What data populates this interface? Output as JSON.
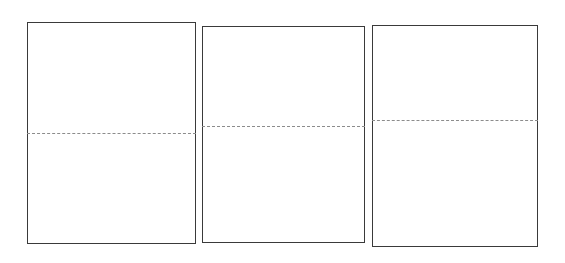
{
  "canvas": {
    "width": 565,
    "height": 263,
    "background_color": "#ffffff"
  },
  "style": {
    "panel_fill_color": "#ffffff",
    "panel_border_color": "#3a3a3a",
    "panel_border_width_px": 1.4,
    "fold_line_color": "#8c8c8c",
    "fold_line_width_px": 1.2,
    "fold_line_style": "dashed"
  },
  "figure": {
    "panel_count": 3,
    "orientation": "horizontal-row",
    "panels": [
      {
        "id": "panel-1",
        "index": 1,
        "x": 27,
        "y": 22,
        "width": 169,
        "height": 222,
        "fold_line": {
          "y_offset_px": 111,
          "y_fraction": 0.5,
          "spans_full_width": true
        }
      },
      {
        "id": "panel-2",
        "index": 2,
        "x": 202,
        "y": 26,
        "width": 163,
        "height": 217,
        "fold_line": {
          "y_offset_px": 100,
          "y_fraction": 0.46,
          "spans_full_width": true
        }
      },
      {
        "id": "panel-3",
        "index": 3,
        "x": 372,
        "y": 25,
        "width": 166,
        "height": 222,
        "fold_line": {
          "y_offset_px": 95,
          "y_fraction": 0.43,
          "spans_full_width": true
        }
      }
    ]
  }
}
